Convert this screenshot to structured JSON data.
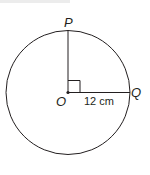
{
  "diagram": {
    "type": "circle",
    "center": {
      "label": "O"
    },
    "points": [
      {
        "label": "P",
        "position": "top of circle"
      },
      {
        "label": "Q",
        "position": "right of circle"
      }
    ],
    "segments": [
      {
        "from": "O",
        "to": "P",
        "label": ""
      },
      {
        "from": "O",
        "to": "Q",
        "label": "12 cm"
      }
    ],
    "right_angle_at": "O",
    "colors": {
      "stroke": "#231f20",
      "background": "#ffffff"
    }
  }
}
